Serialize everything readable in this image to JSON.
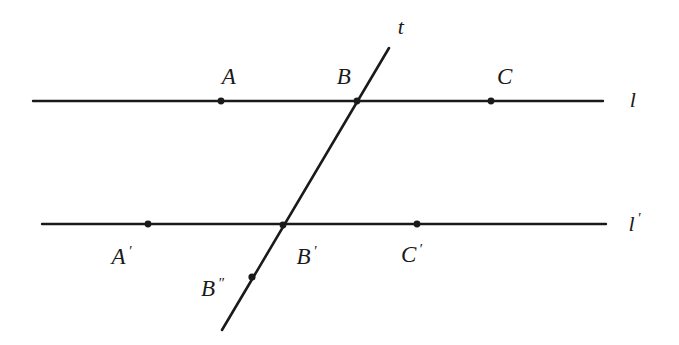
{
  "figure": {
    "type": "geometry-diagram",
    "background_color": "#ffffff",
    "stroke_color": "#1a1a1a",
    "stroke_width": 2.2,
    "point_radius": 3.2,
    "canvas": {
      "width": 679,
      "height": 345
    }
  },
  "lines": [
    {
      "id": "line-l",
      "label": "l",
      "label_x": 633,
      "label_y": 100,
      "x1": 33,
      "y1": 101,
      "x2": 603,
      "y2": 101
    },
    {
      "id": "line-l-prime",
      "label": "l",
      "label_prime": "′",
      "label_x": 635,
      "label_y": 223,
      "x1": 42,
      "y1": 224,
      "x2": 606,
      "y2": 224
    },
    {
      "id": "line-t",
      "label": "t",
      "label_x": 401,
      "label_y": 27,
      "x1": 389,
      "y1": 48,
      "x2": 222,
      "y2": 330
    }
  ],
  "points": [
    {
      "id": "point-a",
      "label": "A",
      "prime": "",
      "x": 221,
      "y": 101,
      "label_x": 229,
      "label_y": 76
    },
    {
      "id": "point-b",
      "label": "B",
      "prime": "",
      "x": 357,
      "y": 101,
      "label_x": 344,
      "label_y": 76
    },
    {
      "id": "point-c",
      "label": "C",
      "prime": "",
      "x": 491,
      "y": 101,
      "label_x": 505,
      "label_y": 76
    },
    {
      "id": "point-a-prime",
      "label": "A",
      "prime": "′",
      "x": 148,
      "y": 224,
      "label_x": 122,
      "label_y": 256
    },
    {
      "id": "point-b-prime",
      "label": "B",
      "prime": "′",
      "x": 283,
      "y": 225,
      "label_x": 307,
      "label_y": 256
    },
    {
      "id": "point-c-prime",
      "label": "C",
      "prime": "′",
      "x": 417,
      "y": 224,
      "label_x": 412,
      "label_y": 254
    },
    {
      "id": "point-b-double-prime",
      "label": "B",
      "prime": "″",
      "x": 252,
      "y": 277,
      "label_x": 213,
      "label_y": 288
    }
  ]
}
